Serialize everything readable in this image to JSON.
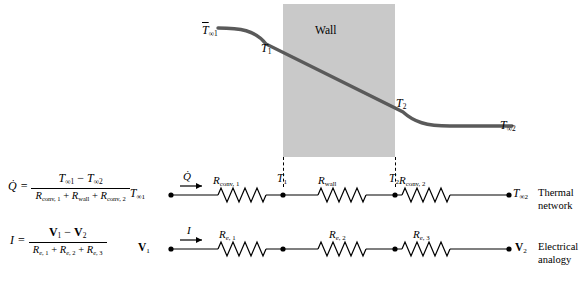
{
  "figure": {
    "wall_label": "Wall",
    "upper": {
      "t_inf1": "T∞1",
      "t1": "T1",
      "t2": "T2",
      "t_inf2": "T∞2"
    },
    "thermal_network": {
      "title_line1": "Thermal",
      "title_line2": "network",
      "equation": {
        "lhs": "Q̇",
        "numerator": "T∞1 − T∞2",
        "denominator": "Rconv, 1 + Rwall + Rconv, 2"
      },
      "left_node": "T∞1",
      "flow_label": "Q̇",
      "resistors": [
        "Rconv, 1",
        "Rwall",
        "Rconv, 2"
      ],
      "inner_nodes": [
        "T1",
        "T2"
      ],
      "right_node": "T∞2"
    },
    "electrical_network": {
      "title_line1": "Electrical",
      "title_line2": "analogy",
      "equation": {
        "lhs": "I",
        "numerator": "V1 − V2",
        "denominator": "Re, 1 + Re, 2 + Re, 3"
      },
      "left_node": "V1",
      "flow_label": "I",
      "resistors": [
        "Re, 1",
        "Re, 2",
        "Re, 3"
      ],
      "right_node": "V2"
    }
  },
  "colors": {
    "wall_fill": "#c9c9c9",
    "curve": "#5a5a5a",
    "line": "#000000"
  }
}
